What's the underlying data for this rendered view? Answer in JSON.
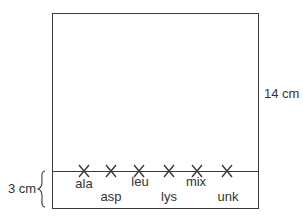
{
  "diagram": {
    "title": "",
    "sheet_height_label": "14 cm",
    "origin_offset_label": "3 cm",
    "spots": [
      {
        "label": "ala",
        "x": 84,
        "label_y": 177
      },
      {
        "label": "asp",
        "x": 111,
        "label_y": 190
      },
      {
        "label": "leu",
        "x": 139,
        "label_y": 175
      },
      {
        "label": "lys",
        "x": 169,
        "label_y": 190
      },
      {
        "label": "mix",
        "x": 197,
        "label_y": 175
      },
      {
        "label": "unk",
        "x": 227,
        "label_y": 190
      }
    ],
    "colors": {
      "line": "#3a3a3a",
      "text": "#333333",
      "background": "#ffffff"
    }
  }
}
